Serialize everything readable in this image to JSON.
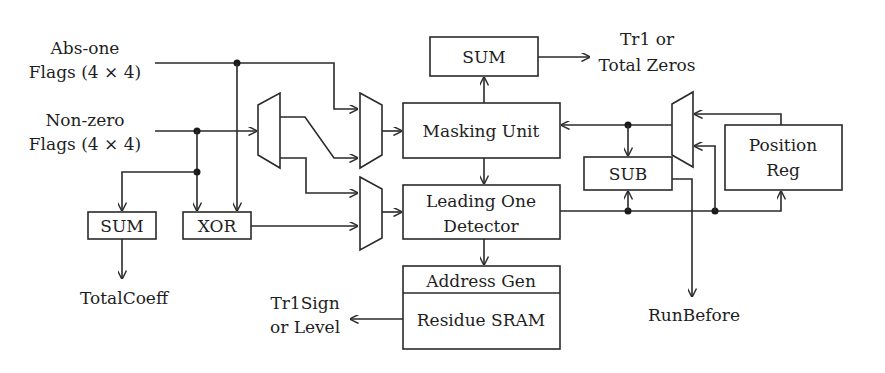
{
  "inputs": {
    "abs_one": {
      "line1": "Abs-one",
      "line2": "Flags (4 × 4)"
    },
    "non_zero": {
      "line1": "Non-zero",
      "line2": "Flags (4 × 4)"
    }
  },
  "blocks": {
    "sum_left": "SUM",
    "xor": "XOR",
    "sum_top": "SUM",
    "masking_unit": "Masking Unit",
    "leading_one": {
      "line1": "Leading One",
      "line2": "Detector"
    },
    "address_gen": "Address Gen",
    "residue_sram": "Residue SRAM",
    "sub": "SUB",
    "position_reg": {
      "line1": "Position",
      "line2": "Reg"
    }
  },
  "outputs": {
    "total_coeff": "TotalCoeff",
    "tr1_total_zeros": {
      "line1": "Tr1 or",
      "line2": "Total Zeros"
    },
    "tr1sign_level": {
      "line1": "Tr1Sign",
      "line2": "or Level"
    },
    "run_before": "RunBefore"
  },
  "colors": {
    "line": "#2a2a2a",
    "background": "#ffffff"
  }
}
